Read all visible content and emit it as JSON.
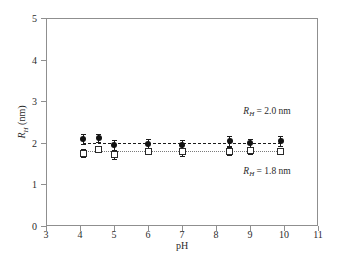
{
  "chart_data": {
    "type": "scatter",
    "title": "",
    "xlabel": "pH",
    "ylabel": "R_H (nm)",
    "ylabel_parts": {
      "symbol": "R",
      "subscript": "H",
      "unit": "(nm)"
    },
    "xlim": [
      3,
      11
    ],
    "ylim": [
      0,
      5
    ],
    "xticks": [
      3,
      4,
      5,
      6,
      7,
      8,
      9,
      10,
      11
    ],
    "yticks": [
      0,
      1,
      2,
      3,
      4,
      5
    ],
    "grid": false,
    "legend": "none",
    "series": [
      {
        "name": "R_H = 2.0 nm",
        "marker": "filled-circle",
        "color": "#111111",
        "line": "dashed",
        "x": [
          4.1,
          4.55,
          5.0,
          6.0,
          7.0,
          8.4,
          9.0,
          9.9
        ],
        "values": [
          2.1,
          2.12,
          1.95,
          1.98,
          1.95,
          2.05,
          2.0,
          2.05
        ],
        "yerr": [
          0.12,
          0.1,
          0.12,
          0.1,
          0.12,
          0.12,
          0.1,
          0.12
        ],
        "fit_value": 2.0
      },
      {
        "name": "R_H = 1.8 nm",
        "marker": "open-square",
        "color": "#2a2a2a",
        "line": "dotted",
        "x": [
          4.1,
          4.55,
          5.0,
          6.0,
          7.0,
          8.4,
          9.0,
          9.9
        ],
        "values": [
          1.75,
          1.85,
          1.72,
          1.8,
          1.78,
          1.8,
          1.82,
          1.8
        ],
        "yerr": [
          0.1,
          0.08,
          0.1,
          0.08,
          0.1,
          0.1,
          0.08,
          0.08
        ],
        "fit_value": 1.8
      }
    ],
    "annotations": [
      {
        "id": "annot-upper",
        "symbol": "R",
        "subscript": "H",
        "text": "= 2.0 nm",
        "x": 9.5,
        "y": 2.75
      },
      {
        "id": "annot-lower",
        "symbol": "R",
        "subscript": "H",
        "text": "= 1.8 nm",
        "x": 9.5,
        "y": 1.3
      }
    ]
  },
  "axes": {
    "x_tick_labels": [
      "3",
      "4",
      "5",
      "6",
      "7",
      "8",
      "9",
      "10",
      "11"
    ],
    "y_tick_labels": [
      "0",
      "1",
      "2",
      "3",
      "4",
      "5"
    ],
    "x_title": "pH"
  },
  "colors": {
    "frame": "#8f8f8f",
    "marker_filled": "#111111",
    "marker_open_edge": "#2a2a2a",
    "dashed_line": "#1c1c1c",
    "dotted_line": "#7a7a7a",
    "background": "#ffffff",
    "text": "#2b2b2b"
  }
}
